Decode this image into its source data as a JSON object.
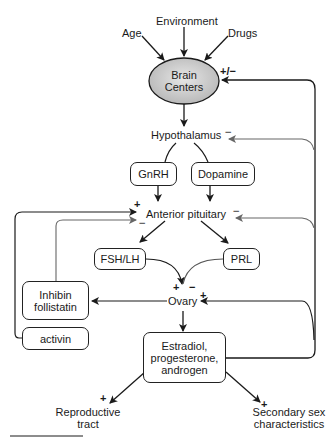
{
  "diagram": {
    "inputs": {
      "age": "Age",
      "environment": "Environment",
      "drugs": "Drugs"
    },
    "brain_centers": {
      "line1": "Brain",
      "line2": "Centers"
    },
    "hypothalamus": "Hypothalamus",
    "gnrh": "GnRH",
    "dopamine": "Dopamine",
    "anterior_pituitary": "Anterior pituitary",
    "fsh_lh": "FSH/LH",
    "prl": "PRL",
    "ovary": "Ovary",
    "inhibin": {
      "line1": "Inhibin",
      "line2": "follistatin"
    },
    "activin": "activin",
    "steroids": {
      "line1": "Estradiol,",
      "line2": "progesterone,",
      "line3": "androgen"
    },
    "reproductive_tract": {
      "line1": "Reproductive",
      "line2": "tract"
    },
    "secondary_sex": {
      "line1": "Secondary sex",
      "line2": "characteristics"
    },
    "signs": {
      "brain_feedback": "+/−",
      "hypothalamus_feedback": "−",
      "pituitary_activin": "+",
      "pituitary_inhibin": "−",
      "pituitary_steroid": "−",
      "ovary_fsh": "+",
      "ovary_prl": "−",
      "ovary_steroid": "+",
      "reproductive": "+",
      "secondary": "+"
    },
    "colors": {
      "line_dark": "#1a1a1a",
      "line_gray": "#666666",
      "ellipse_fill": "#c8c8c8"
    }
  }
}
